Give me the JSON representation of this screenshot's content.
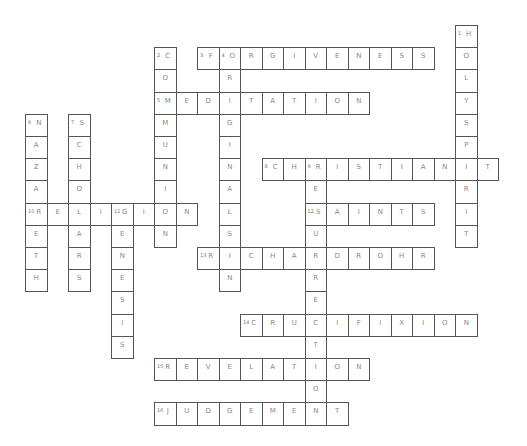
{
  "puzzle": {
    "grid": {
      "origin_x": 25,
      "origin_y": 25,
      "cell_w": 21.5,
      "cell_h": 22.2
    },
    "entries": [
      {
        "number": 1,
        "direction": "down",
        "answer": "HOLYSPIRIT",
        "row": 0,
        "col": 20
      },
      {
        "number": 2,
        "direction": "down",
        "answer": "COMMUNION",
        "row": 1,
        "col": 6
      },
      {
        "number": 3,
        "direction": "across",
        "answer": "FORGIVENESS",
        "row": 1,
        "col": 8
      },
      {
        "number": 4,
        "direction": "down",
        "answer": "ORIGINALSIN",
        "row": 1,
        "col": 9
      },
      {
        "number": 5,
        "direction": "across",
        "answer": "MEDITATION",
        "row": 3,
        "col": 6
      },
      {
        "number": 6,
        "direction": "down",
        "answer": "NAZARETH",
        "row": 4,
        "col": 0
      },
      {
        "number": 7,
        "direction": "down",
        "answer": "SCHOLARS",
        "row": 4,
        "col": 2
      },
      {
        "number": 8,
        "direction": "across",
        "answer": "CHRISTIANIT",
        "row": 6,
        "col": 11
      },
      {
        "number": 9,
        "direction": "down",
        "answer": "RESURRECTION",
        "row": 6,
        "col": 13
      },
      {
        "number": 10,
        "direction": "across",
        "answer": "RELIGION",
        "row": 8,
        "col": 0
      },
      {
        "number": 11,
        "direction": "down",
        "answer": "GENESIS",
        "row": 8,
        "col": 4
      },
      {
        "number": 12,
        "direction": "across",
        "answer": "SAINTS",
        "row": 8,
        "col": 13
      },
      {
        "number": 13,
        "direction": "across",
        "answer": "RICHARDROHR",
        "row": 10,
        "col": 8
      },
      {
        "number": 14,
        "direction": "across",
        "answer": "CRUCIFIXION",
        "row": 13,
        "col": 10
      },
      {
        "number": 15,
        "direction": "across",
        "answer": "REVELATION",
        "row": 15,
        "col": 6
      },
      {
        "number": 16,
        "direction": "across",
        "answer": "JUDGEMENT",
        "row": 17,
        "col": 6
      }
    ]
  }
}
